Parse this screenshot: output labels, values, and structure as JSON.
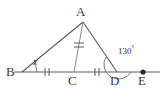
{
  "figure": {
    "type": "geometry-diagram",
    "stroke_color": "#5a5a5a",
    "label_color": "#3a3a3a",
    "background_color": "#ffffff"
  },
  "labels": {
    "apex": "A",
    "left_vertex": "B",
    "midpoint": "C",
    "foot": "D",
    "ray_end": "E",
    "angle_b": "x",
    "angle_d_value": "130",
    "degree_symbol": "°"
  },
  "marks": {
    "tick_bc": "double-tick",
    "tick_cd": "double-tick",
    "tick_ac": "double-tick",
    "arc_b": "angle-arc",
    "arc_d": "angle-arc",
    "point_e": "filled-dot"
  },
  "geometry": {
    "points": {
      "A": [
        83,
        22
      ],
      "B": [
        22,
        72
      ],
      "C": [
        74,
        72
      ],
      "D": [
        117,
        72
      ],
      "E": [
        145,
        72
      ]
    },
    "baseline": [
      14,
      160
    ],
    "angle_b_measure": "x",
    "angle_d_exterior_measure": "130"
  }
}
